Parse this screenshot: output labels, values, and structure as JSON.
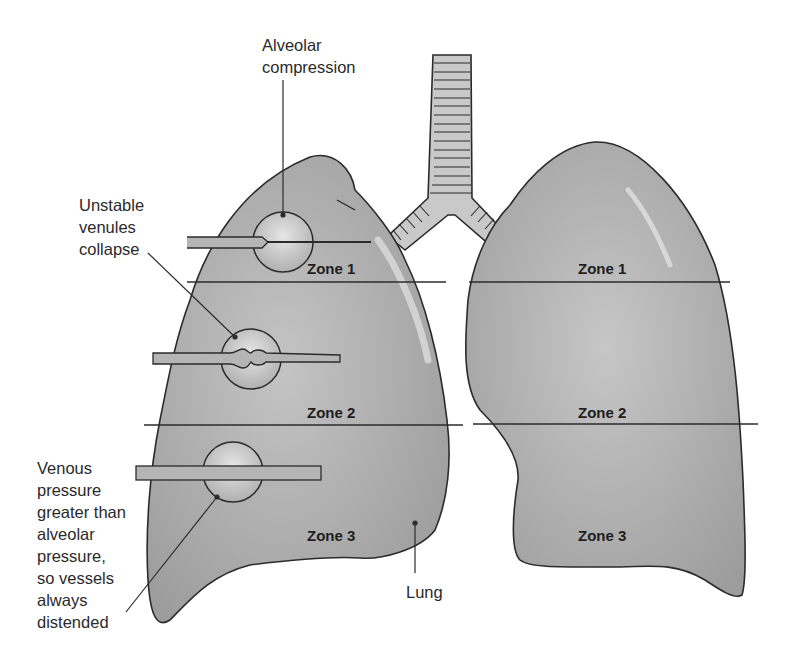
{
  "colors": {
    "lung_fill": "#a9a9a9",
    "lung_highlight": "#d2d2d2",
    "outline": "#2b2b2b",
    "trachea_fill": "#c9c9c9",
    "vessel_fill": "#b5b5b5",
    "alveolus_fill": "#d6d6d6",
    "background": "#ffffff"
  },
  "annotations": {
    "alveolar_compression": "Alveolar\ncompression",
    "unstable_venules": "Unstable\nvenules\ncollapse",
    "venous_pressure": "Venous\npressure\ngreater than\nalveolar\npressure,\nso vessels\nalways\ndistended",
    "lung": "Lung"
  },
  "left_lung": {
    "zones": [
      "Zone 1",
      "Zone 2",
      "Zone 3"
    ]
  },
  "right_lung": {
    "zones": [
      "Zone 1",
      "Zone 2",
      "Zone 3"
    ]
  }
}
